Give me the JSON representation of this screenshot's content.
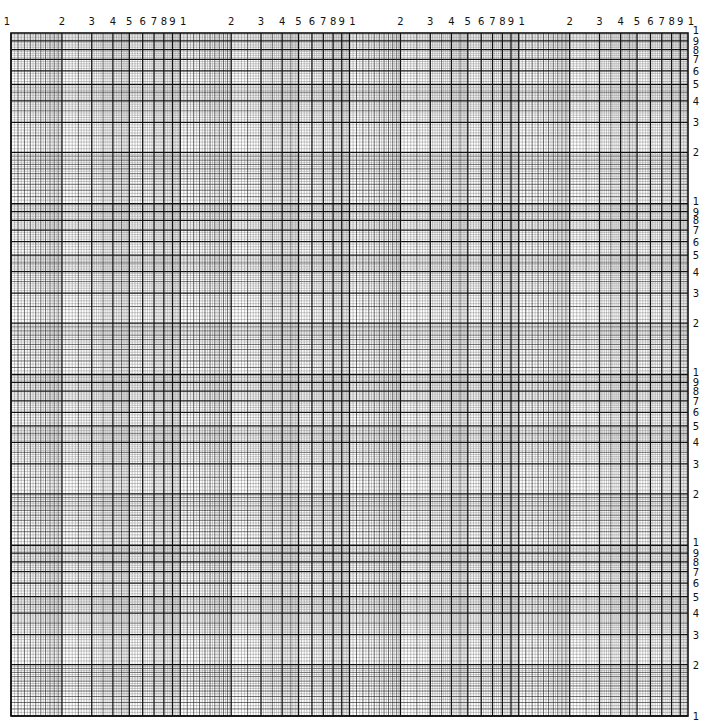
{
  "paper": {
    "type": "log-log graph paper",
    "x_cycles": 4,
    "y_cycles": 4,
    "grid_color": "#111111",
    "background": "#ffffff"
  },
  "geometry": {
    "left": 11,
    "right": 688,
    "top": 33,
    "bottom": 716
  },
  "axis_labels": {
    "top": {
      "first": "1",
      "per_cycle": [
        "2",
        "3",
        "4",
        "5",
        "6",
        "7",
        "8",
        "9",
        "1"
      ]
    },
    "right": {
      "last": "1",
      "per_cycle": [
        "1",
        "9",
        "8",
        "7",
        "6",
        "5",
        "4",
        "3",
        "2"
      ]
    }
  },
  "subdivisions": [
    {
      "from": 1,
      "to": 2,
      "step": 0.05,
      "major_every": 0.1
    },
    {
      "from": 2,
      "to": 5,
      "step": 0.1,
      "major_every": 0.5
    },
    {
      "from": 5,
      "to": 10,
      "step": 0.2,
      "major_every": 1
    }
  ]
}
